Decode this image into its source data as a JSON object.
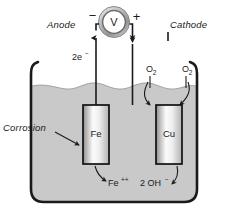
{
  "diagram": {
    "meter": {
      "symbol": "V",
      "negative_sign": "−",
      "positive_sign": "+"
    },
    "labels": {
      "anode": "Anode",
      "cathode": "Cathode",
      "corrosion": "Corrosion"
    },
    "species": {
      "electrons_count": "2e",
      "electrons_charge": "−",
      "oxygen_left": "O",
      "oxygen_left_sub": "2",
      "oxygen_right": "O",
      "oxygen_right_sub": "2",
      "iron_ion": "Fe",
      "iron_ion_charge": "++",
      "hydroxide": "2 OH",
      "hydroxide_charge": "−"
    },
    "electrodes": [
      {
        "name": "Fe",
        "label": "Fe",
        "role": "anode"
      },
      {
        "name": "Cu",
        "label": "Cu",
        "role": "cathode"
      }
    ],
    "colors": {
      "ink": "#1a1a1a",
      "electrolyte": "#c9c9c9",
      "electrode_light": "#f4f4f4",
      "electrode_dark": "#8e8e8e",
      "meter_ring": "#9d9d9d",
      "background": "#ffffff"
    }
  }
}
